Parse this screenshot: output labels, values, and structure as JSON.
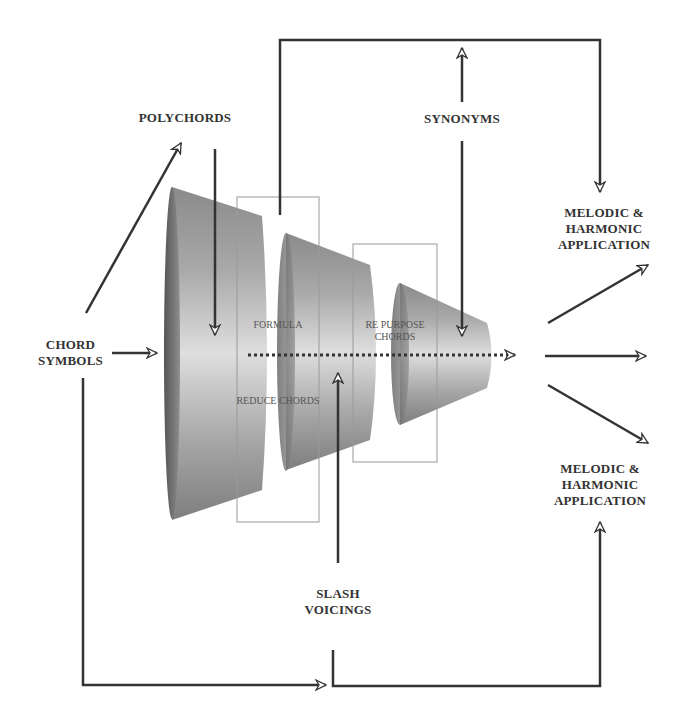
{
  "diagram": {
    "title_labels": {
      "polychords": "POLYCHORDS",
      "synonyms": "SYNONYMS",
      "chord_symbols": [
        "CHORD",
        "SYMBOLS"
      ],
      "slash_voicings": [
        "SLASH",
        "VOICINGS"
      ],
      "melodic_top": [
        "MELODIC &",
        "HARMONIC",
        "APPLICATION"
      ],
      "melodic_bottom": [
        "MELODIC &",
        "HARMONIC",
        "APPLICATION"
      ]
    },
    "inner_labels": {
      "formula": "FORMULA",
      "reduce_chords": "REDUCE CHORDS",
      "repurpose": [
        "RE PURPOSE",
        "CHORDS"
      ]
    },
    "colors": {
      "line": "#333333",
      "box_border": "#9a9a9a",
      "cone_dark": "#6e6e6e",
      "cone_mid": "#a8a8a8",
      "cone_light": "#dcdcdc"
    },
    "stages": [
      {
        "name": "Stage 1 (large cone)"
      },
      {
        "name": "Stage 2 (middle cone)"
      },
      {
        "name": "Stage 3 (small cone)"
      }
    ]
  }
}
